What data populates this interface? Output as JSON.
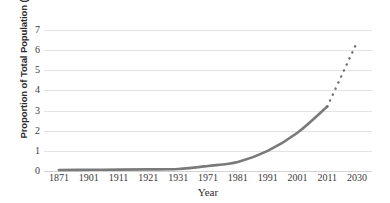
{
  "chart_data": {
    "type": "line",
    "title": "",
    "subtitle": "",
    "xlabel": "Year",
    "ylabel": "Proportion of Total Population (%)",
    "categories": [
      "1871",
      "1901",
      "1911",
      "1921",
      "1931",
      "1971",
      "1981",
      "1991",
      "2001",
      "2011",
      "2030"
    ],
    "ylim": [
      0,
      7
    ],
    "yticks": [
      0,
      1,
      2,
      3,
      4,
      5,
      6,
      7
    ],
    "ytick_labels": [
      "0",
      "1",
      "2",
      "3",
      "4",
      "5",
      "6",
      "7"
    ],
    "grid": true,
    "grid_axis": "y",
    "legend": false,
    "legend_position": "none",
    "series": [
      {
        "name": "Observed",
        "style": "solid",
        "color": "#7a7a7a",
        "x": [
          "1871",
          "1901",
          "1911",
          "1921",
          "1931",
          "1971",
          "1981",
          "1991",
          "2001",
          "2011"
        ],
        "values": [
          0.05,
          0.06,
          0.07,
          0.08,
          0.1,
          0.25,
          0.45,
          1.0,
          1.9,
          3.2
        ]
      },
      {
        "name": "Projected",
        "style": "dotted",
        "color": "#6e6e6e",
        "x": [
          "2011",
          "2030"
        ],
        "values": [
          3.2,
          6.4
        ]
      }
    ],
    "annotations": []
  },
  "figure": {
    "background_color": "#ffffff",
    "grid_color": "#e3e3e3",
    "axis_text_color": "#3a3a3a",
    "label_text_color": "#2b2b2b"
  }
}
